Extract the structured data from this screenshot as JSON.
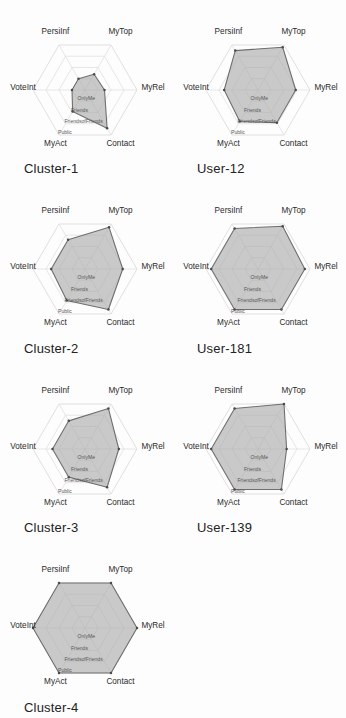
{
  "figure": {
    "orientation": "rotated-90-ccw",
    "background": "#fdfdfd",
    "series_fill": "#a9a9a9",
    "series_stroke": "#6f6f6f",
    "grid_color": "#dcdcdc",
    "text_color": "#2b2b2b"
  },
  "axes": {
    "labels": [
      "VoteInt",
      "PersiInf",
      "MyTop",
      "MyRel",
      "Contact",
      "MyAct"
    ],
    "ring_labels": [
      "OnlyMe",
      "Friends",
      "FriendsofFriends",
      "Public"
    ],
    "ring_axis_name": "MyAct",
    "levels": 4,
    "min": 0,
    "max": 4
  },
  "chart_data": {
    "type": "radar",
    "title": "",
    "categories": [
      "VoteInt",
      "PersiInf",
      "MyTop",
      "MyRel",
      "Contact",
      "MyAct"
    ],
    "rlim": [
      0,
      4
    ],
    "rtick_labels": [
      "OnlyMe",
      "Friends",
      "FriendsofFriends",
      "Public"
    ],
    "grid": true,
    "legend": "none",
    "series": [
      {
        "name": "Cluster-1",
        "values": [
          1.0,
          1.0,
          1.4,
          1.5,
          3.4,
          1.9
        ]
      },
      {
        "name": "Cluster-2",
        "values": [
          2.6,
          2.6,
          3.7,
          2.9,
          3.6,
          2.8
        ]
      },
      {
        "name": "Cluster-3",
        "values": [
          2.5,
          2.5,
          3.6,
          2.6,
          3.4,
          2.5
        ]
      },
      {
        "name": "Cluster-4",
        "values": [
          4.0,
          4.0,
          4.0,
          4.0,
          4.0,
          4.0
        ]
      },
      {
        "name": "User-12",
        "values": [
          2.6,
          3.5,
          3.8,
          2.9,
          2.9,
          2.8
        ]
      },
      {
        "name": "User-181",
        "values": [
          3.6,
          3.6,
          3.8,
          3.6,
          3.6,
          3.6
        ]
      },
      {
        "name": "User-139",
        "values": [
          3.6,
          3.6,
          4.0,
          2.2,
          3.6,
          3.6
        ]
      }
    ]
  },
  "panels": [
    {
      "id": "cluster-4",
      "title": "Cluster-4",
      "series": "Cluster-4"
    },
    {
      "id": "cluster-3",
      "title": "Cluster-3",
      "series": "Cluster-3"
    },
    {
      "id": "cluster-2",
      "title": "Cluster-2",
      "series": "Cluster-2"
    },
    {
      "id": "cluster-1",
      "title": "Cluster-1",
      "series": "Cluster-1"
    },
    {
      "id": "empty-1",
      "title": "",
      "series": null
    },
    {
      "id": "user-139",
      "title": "User-139",
      "series": "User-139"
    },
    {
      "id": "user-181",
      "title": "User-181",
      "series": "User-181"
    },
    {
      "id": "user-12",
      "title": "User-12",
      "series": "User-12"
    }
  ]
}
